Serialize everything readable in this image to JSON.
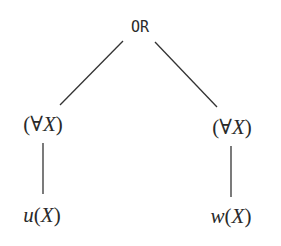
{
  "tree": {
    "root": {
      "label": "OR",
      "x": 140,
      "y": 27
    },
    "children": [
      {
        "quantifier": {
          "open": "(",
          "symbol": "∀",
          "var": "X",
          "close": ")",
          "x": 43,
          "y": 124
        },
        "leaf": {
          "fn": "u",
          "open": "(",
          "var": "X",
          "close": ")",
          "x": 42,
          "y": 215
        }
      },
      {
        "quantifier": {
          "open": "(",
          "symbol": "∀",
          "var": "X",
          "close": ")",
          "x": 232,
          "y": 127
        },
        "leaf": {
          "fn": "w",
          "open": "(",
          "var": "X",
          "close": ")",
          "x": 231,
          "y": 216
        }
      }
    ],
    "edge_color": "#333333"
  }
}
